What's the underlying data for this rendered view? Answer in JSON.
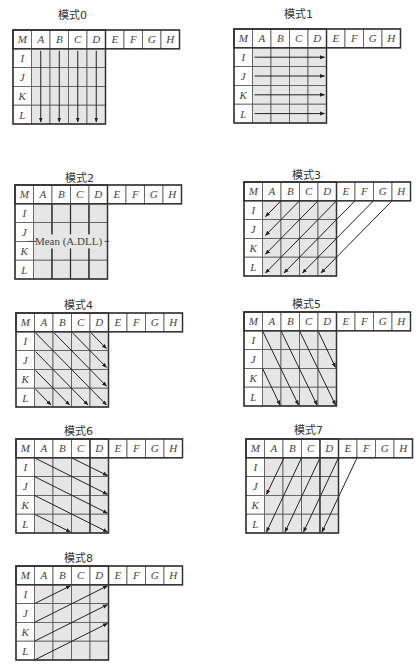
{
  "diagram": {
    "panels": [
      {
        "title": "模式0",
        "pattern": "vertical"
      },
      {
        "title": "模式1",
        "pattern": "horizontal"
      },
      {
        "title": "模式2",
        "pattern": "dc",
        "mean_label": "Mean (A.DLL)"
      },
      {
        "title": "模式3",
        "pattern": "diagonal-down-left"
      },
      {
        "title": "模式4",
        "pattern": "diagonal-down-right"
      },
      {
        "title": "模式5",
        "pattern": "vertical-right"
      },
      {
        "title": "模式6",
        "pattern": "horizontal-down"
      },
      {
        "title": "模式7",
        "pattern": "vertical-left"
      },
      {
        "title": "模式8",
        "pattern": "horizontal-up"
      }
    ],
    "corner_label": "M",
    "top_labels": [
      "A",
      "B",
      "C",
      "D",
      "E",
      "F",
      "G",
      "H"
    ],
    "left_labels": [
      "I",
      "J",
      "K",
      "L"
    ],
    "colors": {
      "predicted_fill": "#e6e6e6",
      "reference_fill": "#ffffff",
      "line": "#555555",
      "arrow": "#222222"
    }
  }
}
